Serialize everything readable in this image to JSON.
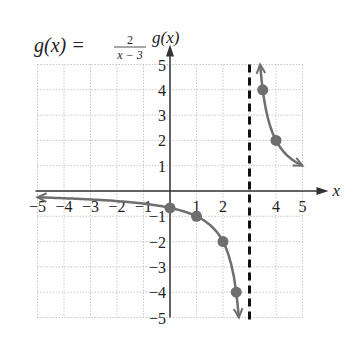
{
  "chart_data": {
    "type": "line",
    "title_parts": {
      "lhs": "g(x) =",
      "numerator": "2",
      "denominator": "x − 3"
    },
    "xlabel": "x",
    "ylabel": "g(x)",
    "xlim": [
      -5,
      5
    ],
    "ylim": [
      -5,
      5
    ],
    "x_ticks": [
      "−5",
      "−4",
      "−3",
      "−2",
      "−1",
      "1",
      "2",
      "4",
      "5"
    ],
    "y_ticks": [
      "5",
      "4",
      "3",
      "2",
      "1",
      "−1",
      "−2",
      "−3",
      "−4",
      "−5"
    ],
    "grid": true,
    "asymptote": {
      "type": "vertical",
      "x": 3,
      "style": "dashed"
    },
    "points": [
      {
        "x": 0,
        "y": -0.667
      },
      {
        "x": 1,
        "y": -1
      },
      {
        "x": 2,
        "y": -2
      },
      {
        "x": 2.5,
        "y": -4
      },
      {
        "x": 3.5,
        "y": 4
      },
      {
        "x": 4,
        "y": 2
      }
    ],
    "series": [
      {
        "name": "left branch",
        "function": "2/(x-3)",
        "domain": [
          -5,
          2.6
        ]
      },
      {
        "name": "right branch",
        "function": "2/(x-3)",
        "domain": [
          3.4,
          5
        ]
      }
    ],
    "colors": {
      "curve": "#6e6e6e",
      "point": "#6e6e6e",
      "axis": "#333333",
      "grid": "#bbbbbb"
    }
  }
}
